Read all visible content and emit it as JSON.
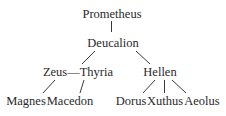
{
  "diagram": {
    "type": "family-tree",
    "nodes": {
      "prometheus": "Prometheus",
      "deucalion": "Deucalion",
      "zeus_thyria": "Zeus—Thyria",
      "hellen": "Hellen",
      "magnes": "Magnes",
      "macedon": "Macedon",
      "dorus": "Dorus",
      "xuthus": "Xuthus",
      "aeolus": "Aeolus"
    },
    "edges": [
      [
        "Prometheus",
        "Deucalion"
      ],
      [
        "Deucalion",
        "Thyria"
      ],
      [
        "Deucalion",
        "Hellen"
      ],
      [
        "Zeus—Thyria",
        "Magnes"
      ],
      [
        "Zeus—Thyria",
        "Macedon"
      ],
      [
        "Hellen",
        "Dorus"
      ],
      [
        "Hellen",
        "Xuthus"
      ],
      [
        "Hellen",
        "Aeolus"
      ]
    ],
    "colors": {
      "text": "#2a2a2a",
      "lines": "#3a3a3a",
      "background": "#ffffff"
    }
  }
}
